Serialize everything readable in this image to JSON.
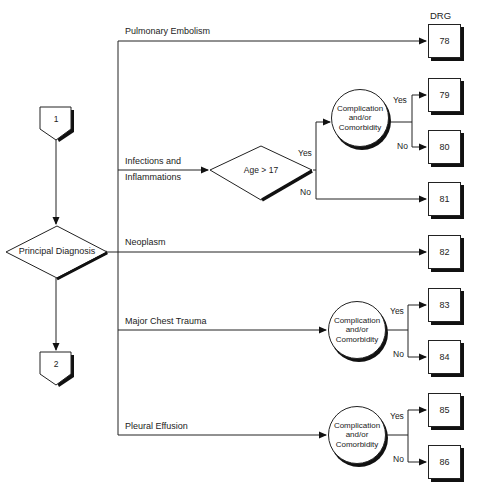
{
  "header": {
    "drg_label": "DRG"
  },
  "connectors": {
    "start": "1",
    "end": "2"
  },
  "decision": {
    "principal": "Principal Diagnosis",
    "age": "Age > 17"
  },
  "branches": [
    {
      "label": "Pulmonary Embolism"
    },
    {
      "label_line1": "Infections and",
      "label_line2": "Inflammations"
    },
    {
      "label": "Neoplasm"
    },
    {
      "label": "Major Chest Trauma"
    },
    {
      "label": "Pleural Effusion"
    }
  ],
  "cc": {
    "line1": "Complication",
    "line2": "and/or",
    "line3": "Comorbidity"
  },
  "answers": {
    "yes": "Yes",
    "no": "No"
  },
  "drg_boxes": [
    "78",
    "79",
    "80",
    "81",
    "82",
    "83",
    "84",
    "85",
    "86"
  ]
}
